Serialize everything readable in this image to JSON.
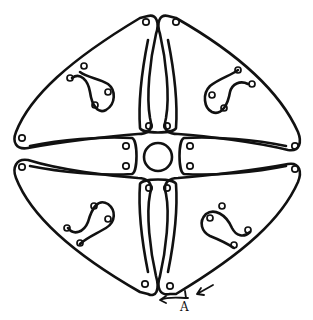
{
  "diagram": {
    "type": "line-art loop diagram",
    "colors": {
      "stroke": "#111111",
      "background": "#ffffff"
    },
    "components": {
      "outer_loops": 4,
      "inner_arms": 4,
      "center_circle": 1,
      "inner_spiral_loops": 4
    },
    "annotation": {
      "label": "A",
      "arrows": [
        "arrow-pointing-left-along-curve",
        "arrow-pointing-toward-A"
      ]
    }
  }
}
